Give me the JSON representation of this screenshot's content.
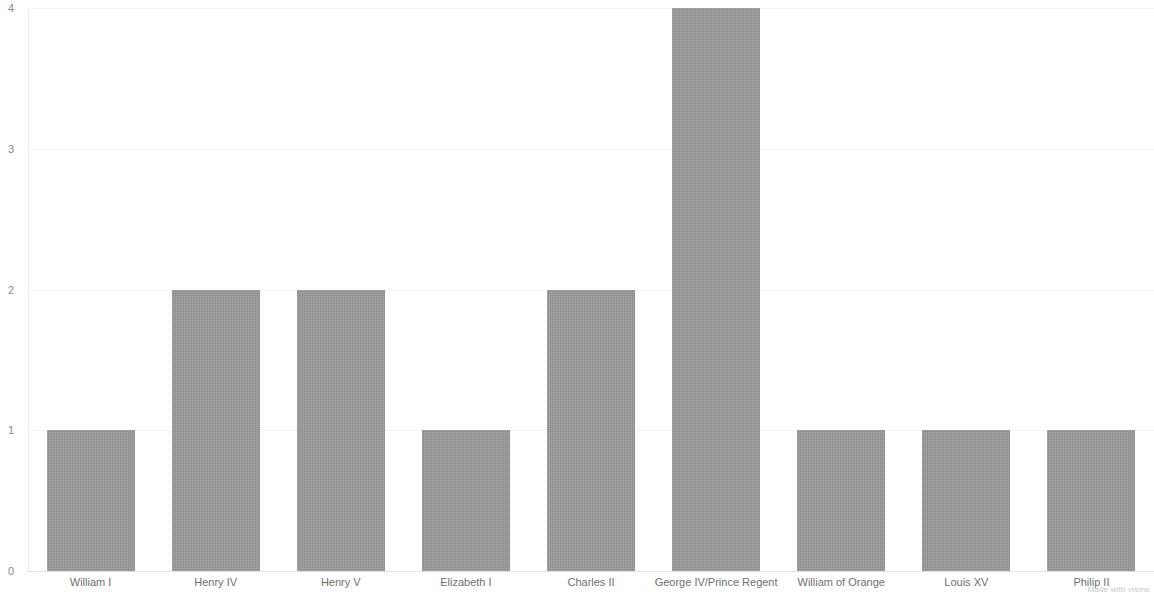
{
  "chart_data": {
    "type": "bar",
    "title": "",
    "subtitle": "",
    "xlabel": "",
    "ylabel": "",
    "ylim": [
      0,
      4
    ],
    "yticks": [
      0,
      1,
      2,
      3,
      4
    ],
    "grid": true,
    "legend": null,
    "orientation": "vertical",
    "bar_color": "#999999",
    "background_color": "#ffffff",
    "categories": [
      "William I",
      "Henry IV",
      "Henry V",
      "Elizabeth I",
      "Charles II",
      "George IV/Prince Regent",
      "William of Orange",
      "Louis XV",
      "Philip II"
    ],
    "values": [
      1,
      2,
      2,
      1,
      2,
      4,
      1,
      1,
      1
    ]
  },
  "watermark": {
    "text": "Made with visme"
  }
}
